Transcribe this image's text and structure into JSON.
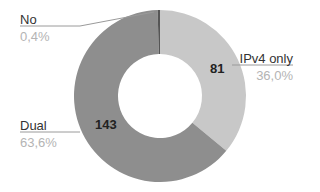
{
  "chart_data": {
    "type": "pie",
    "subtype": "donut",
    "title": "",
    "categories": [
      "IPv4 only",
      "Dual",
      "No"
    ],
    "values": [
      81,
      143,
      1
    ],
    "percentages": [
      "36,0%",
      "63,6%",
      "0,4%"
    ],
    "value_labels": [
      "81",
      "143",
      ""
    ],
    "colors": [
      "#c8c8c8",
      "#8e8e8e",
      "#555555"
    ],
    "start_angle_deg": 0,
    "direction": "clockwise",
    "legend": "none",
    "labels_position": "outside-with-leader-lines"
  },
  "slices": [
    {
      "label": "IPv4 only",
      "percent": "36,0%",
      "value": "81"
    },
    {
      "label": "Dual",
      "percent": "63,6%",
      "value": "143"
    },
    {
      "label": "No",
      "percent": "0,4%",
      "value": ""
    }
  ]
}
